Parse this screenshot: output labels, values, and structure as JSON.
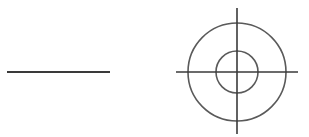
{
  "diagram": {
    "background": "#ffffff",
    "stroke_color": "#3a3a3a",
    "circle_color": "#5a5a5a",
    "elements": {
      "line": {
        "x1": 7,
        "y1": 72,
        "x2": 110,
        "y2": 72
      },
      "crosshair": {
        "cx": 237,
        "cy": 72,
        "outer_radius": 49,
        "inner_radius": 21,
        "h_line": {
          "x1": 176,
          "x2": 298
        },
        "v_line": {
          "y1": 8,
          "y2": 134
        }
      }
    }
  }
}
